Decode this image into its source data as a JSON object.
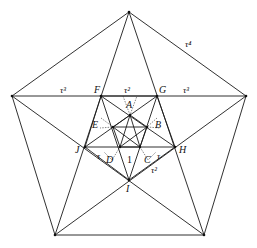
{
  "diagram": {
    "vertex_labels": {
      "F": "F",
      "G": "G",
      "H": "H",
      "I": "I",
      "J": "J",
      "A": "A",
      "B": "B",
      "C": "C",
      "D": "D",
      "E": "E"
    },
    "edge_labels": {
      "outer_side": "τ⁴",
      "left_segment": "τ³",
      "right_segment": "τ³",
      "top_inner": "τ²",
      "lower_right": "τ²",
      "small_left": "τ",
      "small_right": "τ",
      "center": "1"
    },
    "colors": {
      "line": "#1a1a1a",
      "background": "#ffffff"
    }
  }
}
